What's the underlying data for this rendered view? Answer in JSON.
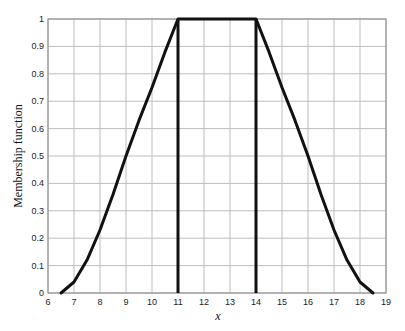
{
  "chart_data": {
    "type": "line",
    "title": "",
    "xlabel": "x",
    "ylabel": "Membership function",
    "xlim": [
      6,
      19
    ],
    "ylim": [
      0,
      1
    ],
    "grid": true,
    "legend": null,
    "x_ticks": [
      6,
      7,
      8,
      9,
      10,
      11,
      12,
      13,
      14,
      15,
      16,
      17,
      18,
      19
    ],
    "y_ticks": [
      0,
      0.1,
      0.2,
      0.3,
      0.4,
      0.5,
      0.6,
      0.7,
      0.8,
      0.9,
      1
    ],
    "y_tick_labels": [
      "0",
      "0.1",
      "0.2",
      "0.3",
      "0.4",
      "0.5",
      "0.6",
      "0.7",
      "0.8",
      "0.9",
      "1"
    ],
    "series": [
      {
        "name": "membership",
        "color": "#111111",
        "x": [
          6.5,
          7,
          7.5,
          8,
          8.5,
          9,
          9.5,
          10,
          10.5,
          11,
          11.5,
          12,
          12.5,
          13,
          13.5,
          14,
          14.5,
          15,
          15.5,
          16,
          16.5,
          17,
          17.5,
          18,
          18.5
        ],
        "y": [
          0,
          0.04,
          0.12,
          0.23,
          0.36,
          0.5,
          0.63,
          0.75,
          0.88,
          1,
          1,
          1,
          1,
          1,
          1,
          1,
          0.88,
          0.75,
          0.63,
          0.5,
          0.36,
          0.23,
          0.12,
          0.04,
          0
        ]
      }
    ],
    "vertical_lines": [
      {
        "x": 11,
        "y0": 0,
        "y1": 1,
        "color": "#111111"
      },
      {
        "x": 14,
        "y0": 0,
        "y1": 1,
        "color": "#111111"
      }
    ]
  }
}
